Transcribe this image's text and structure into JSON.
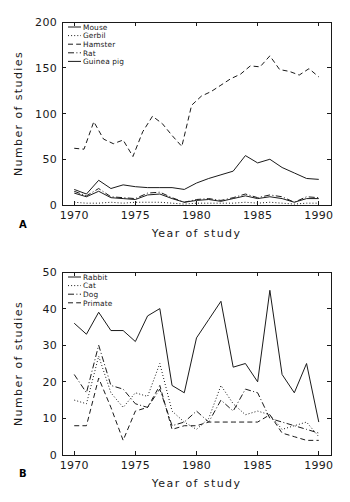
{
  "figure": {
    "panels": [
      {
        "letter": "A",
        "xlabel": "Year of study",
        "ylabel": "Number of studies"
      },
      {
        "letter": "B",
        "xlabel": "Year of study",
        "ylabel": "Number of studies"
      }
    ]
  },
  "chart_data": [
    {
      "type": "line",
      "panel": "A",
      "title": "",
      "xlabel": "Year of study",
      "ylabel": "Number of studies",
      "xlim": [
        1969,
        1991
      ],
      "ylim": [
        0,
        200
      ],
      "xticks": [
        1970,
        1975,
        1980,
        1985,
        1990
      ],
      "yticks": [
        0,
        50,
        100,
        150,
        200
      ],
      "grid": false,
      "legend_position": "upper-left",
      "x": [
        1970,
        1971,
        1972,
        1973,
        1974,
        1975,
        1976,
        1977,
        1978,
        1979,
        1980,
        1981,
        1982,
        1983,
        1984,
        1985,
        1986,
        1987,
        1988,
        1989,
        1990
      ],
      "series": [
        {
          "name": "Mouse",
          "linestyle": "solid",
          "values": [
            17,
            12,
            27,
            18,
            22,
            20,
            19,
            19,
            19,
            17,
            24,
            29,
            33,
            37,
            54,
            46,
            50,
            41,
            35,
            29,
            28
          ]
        },
        {
          "name": "Gerbil",
          "linestyle": "dotted",
          "values": [
            3,
            2,
            2,
            3,
            2,
            3,
            3,
            3,
            2,
            1,
            2,
            2,
            2,
            2,
            3,
            2,
            3,
            2,
            1,
            2,
            2
          ]
        },
        {
          "name": "Hamster",
          "linestyle": "dashed",
          "values": [
            62,
            61,
            91,
            72,
            67,
            71,
            53,
            80,
            97,
            89,
            76,
            64,
            109,
            119,
            124,
            131,
            138,
            143,
            152,
            151,
            163,
            148,
            146,
            142,
            149,
            140
          ]
        },
        {
          "name": "Rat",
          "linestyle": "dashdot",
          "values": [
            15,
            10,
            18,
            9,
            8,
            7,
            13,
            14,
            8,
            3,
            6,
            7,
            5,
            8,
            12,
            8,
            11,
            9,
            3,
            9,
            8
          ]
        },
        {
          "name": "Guinea pig",
          "linestyle": "solid",
          "values": [
            13,
            9,
            15,
            8,
            7,
            6,
            11,
            12,
            7,
            3,
            5,
            6,
            4,
            7,
            10,
            7,
            9,
            7,
            3,
            7,
            7
          ]
        }
      ]
    },
    {
      "type": "line",
      "panel": "B",
      "title": "",
      "xlabel": "Year of study",
      "ylabel": "Number of studies",
      "xlim": [
        1969,
        1991
      ],
      "ylim": [
        0,
        50
      ],
      "xticks": [
        1970,
        1975,
        1980,
        1985,
        1990
      ],
      "yticks": [
        0,
        10,
        20,
        30,
        40,
        50
      ],
      "grid": false,
      "legend_position": "upper-left",
      "x": [
        1970,
        1971,
        1972,
        1973,
        1974,
        1975,
        1976,
        1977,
        1978,
        1979,
        1980,
        1981,
        1982,
        1983,
        1984,
        1985,
        1986,
        1987,
        1988,
        1989,
        1990
      ],
      "series": [
        {
          "name": "Rabbit",
          "linestyle": "solid",
          "values": [
            36,
            33,
            39,
            34,
            34,
            31,
            38,
            40,
            19,
            17,
            32,
            37,
            42,
            24,
            25,
            20,
            45,
            22,
            17,
            25,
            9
          ]
        },
        {
          "name": "Cat",
          "linestyle": "dotted",
          "values": [
            15,
            14,
            27,
            17,
            13,
            17,
            16,
            25,
            12,
            9,
            7,
            10,
            19,
            14,
            11,
            12,
            11,
            7,
            8,
            9,
            5
          ]
        },
        {
          "name": "Dog",
          "linestyle": "dashdot",
          "values": [
            22,
            17,
            30,
            19,
            18,
            14,
            13,
            18,
            8,
            9,
            12,
            9,
            15,
            12,
            18,
            17,
            10,
            9,
            8,
            7,
            6
          ]
        },
        {
          "name": "Primate",
          "linestyle": "dashed",
          "values": [
            8,
            8,
            21,
            13,
            4,
            12,
            13,
            19,
            7,
            8,
            8,
            9,
            9,
            9,
            9,
            9,
            11,
            6,
            5,
            4,
            4
          ]
        }
      ]
    }
  ]
}
